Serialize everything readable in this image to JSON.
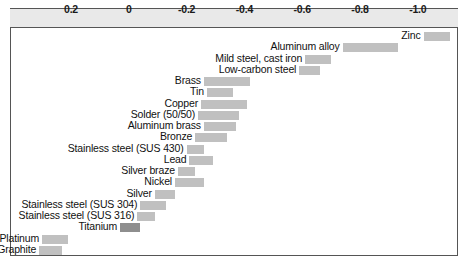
{
  "chart_data": {
    "type": "bar",
    "orientation": "horizontal",
    "title": "",
    "xlabel": "",
    "ylabel": "",
    "xlim": [
      0.3,
      -1.1
    ],
    "axis_direction": "decreasing-left-to-right",
    "grid": true,
    "legend": false,
    "tick_labels": [
      "0.2",
      "0",
      "-0.2",
      "-0.4",
      "-0.6",
      "-0.8",
      "-1.0"
    ],
    "tick_values": [
      0.2,
      0,
      -0.2,
      -0.4,
      -0.6,
      -0.8,
      -1.0
    ],
    "bar_color": "#c0c0c0",
    "highlight_color": "#8e8e8e",
    "categories": [
      "Zinc",
      "Aluminum alloy",
      "Mild steel, cast iron",
      "Low-carbon steel",
      "Brass",
      "Tin",
      "Copper",
      "Solder (50/50)",
      "Aluminum brass",
      "Bronze",
      "Stainless steel (SUS 430)",
      "Lead",
      "Silver braze",
      "Nickel",
      "Silver",
      "Stainless steel (SUS 304)",
      "Stainless steel (SUS 316)",
      "Titanium",
      "Platinum",
      "Graphite"
    ],
    "ranges": [
      {
        "label": "Zinc",
        "start": -1.02,
        "end": -1.11,
        "highlight": false
      },
      {
        "label": "Aluminum alloy",
        "start": -0.74,
        "end": -0.93,
        "highlight": false
      },
      {
        "label": "Mild steel, cast iron",
        "start": -0.61,
        "end": -0.7,
        "highlight": false
      },
      {
        "label": "Low-carbon steel",
        "start": -0.59,
        "end": -0.66,
        "highlight": false
      },
      {
        "label": "Brass",
        "start": -0.26,
        "end": -0.42,
        "highlight": false
      },
      {
        "label": "Tin",
        "start": -0.27,
        "end": -0.36,
        "highlight": false
      },
      {
        "label": "Copper",
        "start": -0.25,
        "end": -0.41,
        "highlight": false
      },
      {
        "label": "Solder (50/50)",
        "start": -0.24,
        "end": -0.38,
        "highlight": false
      },
      {
        "label": "Aluminum brass",
        "start": -0.26,
        "end": -0.37,
        "highlight": false
      },
      {
        "label": "Bronze",
        "start": -0.23,
        "end": -0.34,
        "highlight": false
      },
      {
        "label": "Stainless steel (SUS 430)",
        "start": -0.2,
        "end": -0.26,
        "highlight": false
      },
      {
        "label": "Lead",
        "start": -0.21,
        "end": -0.29,
        "highlight": false
      },
      {
        "label": "Silver braze",
        "start": -0.17,
        "end": -0.23,
        "highlight": false
      },
      {
        "label": "Nickel",
        "start": -0.16,
        "end": -0.26,
        "highlight": false
      },
      {
        "label": "Silver",
        "start": -0.09,
        "end": -0.16,
        "highlight": false
      },
      {
        "label": "Stainless steel (SUS 304)",
        "start": -0.04,
        "end": -0.13,
        "highlight": false
      },
      {
        "label": "Stainless steel (SUS 316)",
        "start": -0.03,
        "end": -0.09,
        "highlight": false
      },
      {
        "label": "Titanium",
        "start": 0.03,
        "end": -0.04,
        "highlight": true
      },
      {
        "label": "Platinum",
        "start": 0.3,
        "end": 0.21,
        "highlight": false
      },
      {
        "label": "Graphite",
        "start": 0.31,
        "end": 0.23,
        "highlight": false
      }
    ]
  }
}
